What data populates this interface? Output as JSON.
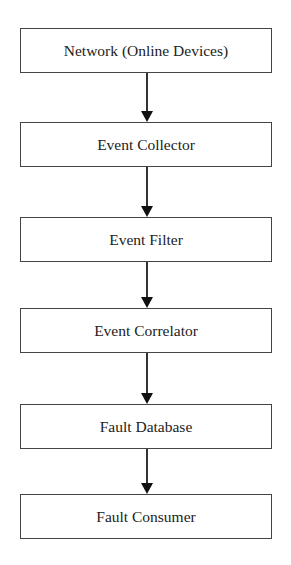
{
  "diagram": {
    "type": "flowchart",
    "direction": "top-to-bottom",
    "nodes": [
      {
        "id": "network",
        "label": "Network (Online Devices)",
        "top": 28
      },
      {
        "id": "collector",
        "label": "Event Collector",
        "top": 122
      },
      {
        "id": "filter",
        "label": "Event Filter",
        "top": 217
      },
      {
        "id": "correlator",
        "label": "Event Correlator",
        "top": 308
      },
      {
        "id": "database",
        "label": "Fault Database",
        "top": 404
      },
      {
        "id": "consumer",
        "label": "Fault Consumer",
        "top": 494
      }
    ],
    "edges": [
      {
        "from": "network",
        "to": "collector"
      },
      {
        "from": "collector",
        "to": "filter"
      },
      {
        "from": "filter",
        "to": "correlator"
      },
      {
        "from": "correlator",
        "to": "database"
      },
      {
        "from": "database",
        "to": "consumer"
      }
    ]
  }
}
